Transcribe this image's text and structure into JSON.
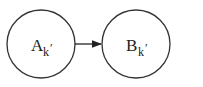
{
  "diagram": {
    "nodes": [
      {
        "id": "A",
        "label": "A",
        "subscript": "k",
        "prime": "′",
        "cx": 41,
        "cy": 44,
        "r": 34
      },
      {
        "id": "B",
        "label": "B",
        "subscript": "k",
        "prime": "′",
        "cx": 136,
        "cy": 44,
        "r": 34
      }
    ],
    "edges": [
      {
        "from": "A",
        "to": "B",
        "type": "directed-arrow"
      }
    ],
    "colors": {
      "stroke": "#333333",
      "background": "#ffffff"
    }
  }
}
